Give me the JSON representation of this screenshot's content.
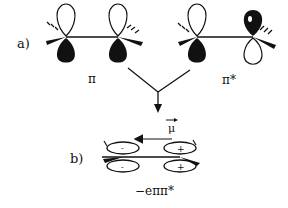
{
  "diagram": {
    "panel_a": {
      "label": "a)",
      "orbitals": [
        {
          "name": "pi",
          "label": "π"
        },
        {
          "name": "pi-star",
          "label": "π*"
        }
      ]
    },
    "panel_b": {
      "label": "b)",
      "dipole_label": "μ",
      "lobe_signs": {
        "left_top": "-",
        "left_bottom": "-",
        "right_top": "+",
        "right_bottom": "+"
      },
      "caption": "−eππ*"
    },
    "colors": {
      "ink": "#111111",
      "background": "#ffffff"
    }
  }
}
